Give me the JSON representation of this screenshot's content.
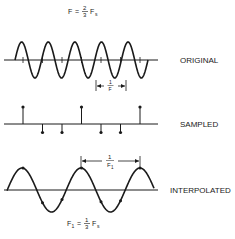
{
  "title_formula": {
    "lhs": "F",
    "eq": "=",
    "num": "2",
    "den": "3",
    "var": "F",
    "sub": "s"
  },
  "panels": {
    "original": {
      "label": "ORIGINAL",
      "cycles": 5,
      "period_label_num": "1",
      "period_label_den": "F"
    },
    "sampled": {
      "label": "SAMPLED",
      "sample_values": [
        1,
        -0.5,
        -0.5,
        1,
        -0.5,
        -0.5,
        1
      ]
    },
    "interpolated": {
      "label": "INTERPOLATED",
      "cycles": 2.5,
      "period_label_num": "1",
      "period_label_den": "F",
      "period_label_den_sub": "1"
    }
  },
  "bottom_formula": {
    "lhs": "F",
    "lhs_sub": "1",
    "eq": "=",
    "num": "1",
    "den": "3",
    "var": "F",
    "sub": "s"
  }
}
